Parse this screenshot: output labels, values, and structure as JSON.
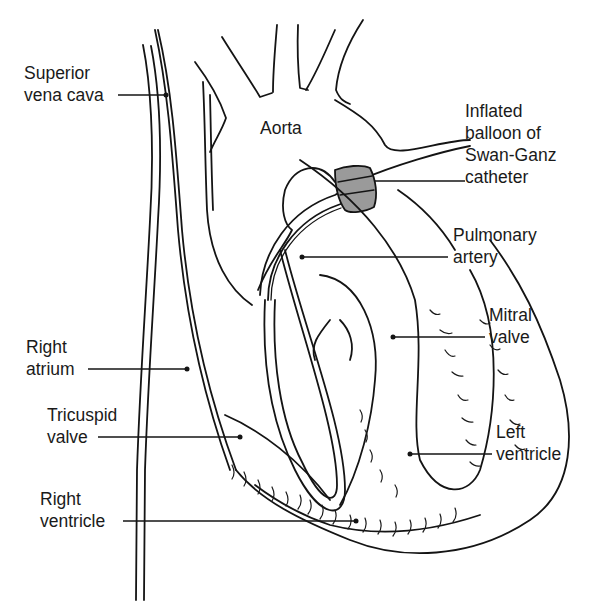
{
  "diagram": {
    "colors": {
      "ink": "#141414",
      "background": "#ffffff",
      "balloon_fill": "#9a9a9a"
    },
    "labels": {
      "superior_vena_cava": [
        "Superior",
        "vena cava"
      ],
      "aorta": [
        "Aorta"
      ],
      "balloon": [
        "Inflated",
        "balloon of",
        "Swan-Ganz",
        "catheter"
      ],
      "pulmonary_artery": [
        "Pulmonary",
        "artery"
      ],
      "mitral_valve": [
        "Mitral",
        "valve"
      ],
      "right_atrium": [
        "Right",
        "atrium"
      ],
      "tricuspid_valve": [
        "Tricuspid",
        "valve"
      ],
      "left_ventricle": [
        "Left",
        "ventricle"
      ],
      "right_ventricle": [
        "Right",
        "ventricle"
      ]
    }
  }
}
